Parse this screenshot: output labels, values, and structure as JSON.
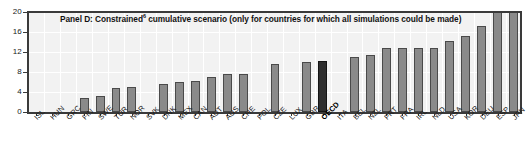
{
  "chart_data": {
    "type": "bar",
    "title": "Panel D: Constrained",
    "title_superscript": "6",
    "title_rest": " cumulative scenario (only for countries for which all simulations could be made)",
    "title_full": "Panel D: Constrained6 cumulative scenario (only for countries for which all simulations could be made)",
    "xlabel": "",
    "ylabel": "",
    "ylim": [
      0,
      20
    ],
    "yticks": [
      0,
      4,
      8,
      12,
      16,
      20
    ],
    "ytick_labels": [
      "0",
      "4",
      "8",
      "12",
      "16",
      "20"
    ],
    "grid": true,
    "legend": "none",
    "highlight_category": "OECD",
    "categories": [
      "ISL",
      "HUN",
      "GRC",
      "FIN",
      "SWE",
      "TUR",
      "NOR",
      "SVK",
      "DNK",
      "MEX",
      "CAN",
      "AUT",
      "AUS",
      "CHE",
      "POL",
      "CZE",
      "LUX",
      "GBR",
      "OECD",
      "ITA",
      "BEL",
      "NZL",
      "PRT",
      "FRA",
      "IRL",
      "NLD",
      "USA",
      "KOR",
      "DEU",
      "ESP",
      "JPN"
    ],
    "values": [
      0,
      0,
      0,
      2.8,
      3.3,
      4.8,
      5.0,
      0,
      5.7,
      6.1,
      6.3,
      7.1,
      7.6,
      7.6,
      0,
      9.6,
      0,
      10.1,
      10.3,
      0,
      11.0,
      11.5,
      12.8,
      12.9,
      12.9,
      12.9,
      14.2,
      15.2,
      17.3,
      20.0,
      20.0
    ],
    "bar_colors": {
      "default": "#8a8a8a",
      "highlight": "#2e2e2e",
      "border": "#4a4a4a"
    },
    "plot_background": "#f2f2f2",
    "axis_color": "#3a3a3a"
  }
}
